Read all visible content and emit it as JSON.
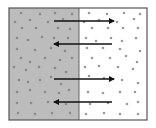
{
  "diagram": {
    "type": "diffusion-membrane",
    "box": {
      "x": 9,
      "y": 8,
      "width": 138,
      "height": 112,
      "border_color": "#555555"
    },
    "divider": {
      "x": 79,
      "color": "#666666"
    },
    "left_region": {
      "label": "high concentration",
      "fill": "#bcbcbc",
      "dot_color": "#8a8a8a"
    },
    "right_region": {
      "label": "low concentration",
      "fill": "#ffffff",
      "dot_color": "#9a9a9a"
    },
    "arrows": [
      {
        "id": "arrow-1",
        "direction": "right",
        "x1": 54,
        "x2": 114,
        "y": 21
      },
      {
        "id": "arrow-2",
        "direction": "left",
        "x1": 112,
        "x2": 54,
        "y": 44
      },
      {
        "id": "arrow-3",
        "direction": "right",
        "x1": 54,
        "x2": 114,
        "y": 79
      },
      {
        "id": "arrow-4",
        "direction": "left",
        "x1": 112,
        "x2": 54,
        "y": 102
      }
    ],
    "arrow_color": "#111111",
    "dots_left": [
      [
        21,
        13
      ],
      [
        40,
        14
      ],
      [
        55,
        13
      ],
      [
        72,
        14
      ],
      [
        15,
        22
      ],
      [
        30,
        20
      ],
      [
        48,
        22
      ],
      [
        63,
        19
      ],
      [
        22,
        28
      ],
      [
        36,
        28
      ],
      [
        58,
        28
      ],
      [
        70,
        29
      ],
      [
        17,
        38
      ],
      [
        28,
        40
      ],
      [
        42,
        37
      ],
      [
        54,
        38
      ],
      [
        68,
        38
      ],
      [
        17,
        49
      ],
      [
        35,
        50
      ],
      [
        51,
        48
      ],
      [
        65,
        51
      ],
      [
        21,
        58
      ],
      [
        30,
        62
      ],
      [
        45,
        58
      ],
      [
        60,
        60
      ],
      [
        72,
        58
      ],
      [
        14,
        67
      ],
      [
        26,
        70
      ],
      [
        39,
        67
      ],
      [
        55,
        68
      ],
      [
        66,
        72
      ],
      [
        19,
        80
      ],
      [
        28,
        82
      ],
      [
        40,
        80
      ],
      [
        51,
        77
      ],
      [
        61,
        84
      ],
      [
        17,
        92
      ],
      [
        30,
        90
      ],
      [
        45,
        92
      ],
      [
        59,
        93
      ],
      [
        69,
        90
      ],
      [
        17,
        103
      ],
      [
        31,
        103
      ],
      [
        48,
        102
      ],
      [
        66,
        104
      ],
      [
        18,
        113
      ],
      [
        35,
        114
      ],
      [
        52,
        113
      ],
      [
        70,
        113
      ]
    ],
    "dots_right": [
      [
        89,
        13
      ],
      [
        107,
        14
      ],
      [
        124,
        13
      ],
      [
        140,
        14
      ],
      [
        84,
        22
      ],
      [
        99,
        20
      ],
      [
        117,
        22
      ],
      [
        134,
        19
      ],
      [
        92,
        28
      ],
      [
        108,
        28
      ],
      [
        123,
        28
      ],
      [
        138,
        28
      ],
      [
        86,
        38
      ],
      [
        96,
        41
      ],
      [
        111,
        38
      ],
      [
        122,
        41
      ],
      [
        136,
        38
      ],
      [
        87,
        48
      ],
      [
        103,
        48
      ],
      [
        120,
        49
      ],
      [
        140,
        51
      ],
      [
        92,
        58
      ],
      [
        110,
        58
      ],
      [
        126,
        56
      ],
      [
        137,
        62
      ],
      [
        85,
        67
      ],
      [
        99,
        66
      ],
      [
        118,
        67
      ],
      [
        133,
        69
      ],
      [
        89,
        76
      ],
      [
        104,
        78
      ],
      [
        122,
        80
      ],
      [
        138,
        83
      ],
      [
        88,
        92
      ],
      [
        103,
        93
      ],
      [
        120,
        92
      ],
      [
        135,
        92
      ],
      [
        90,
        104
      ],
      [
        108,
        103
      ],
      [
        127,
        104
      ],
      [
        138,
        102
      ],
      [
        86,
        114
      ],
      [
        104,
        113
      ],
      [
        120,
        114
      ],
      [
        138,
        114
      ]
    ]
  }
}
